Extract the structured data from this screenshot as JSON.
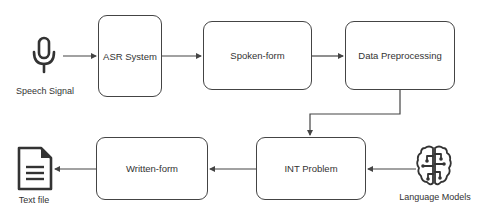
{
  "diagram": {
    "type": "flowchart",
    "direction": "left-to-right then right-to-left",
    "colors": {
      "stroke": "#444444",
      "text": "#333333",
      "background": "#ffffff"
    },
    "nodes": [
      {
        "id": "speech_signal",
        "label": "Speech Signal",
        "kind": "icon",
        "icon": "microphone-icon"
      },
      {
        "id": "asr_system",
        "label": "ASR System",
        "kind": "box"
      },
      {
        "id": "spoken_form",
        "label": "Spoken-form",
        "kind": "box"
      },
      {
        "id": "data_preprocessing",
        "label": "Data Preprocessing",
        "kind": "box"
      },
      {
        "id": "int_problem",
        "label": "INT Problem",
        "kind": "box"
      },
      {
        "id": "language_models",
        "label": "Language Models",
        "kind": "icon",
        "icon": "brain-circuit-icon"
      },
      {
        "id": "written_form",
        "label": "Written-form",
        "kind": "box"
      },
      {
        "id": "text_file",
        "label": "Text file",
        "kind": "icon",
        "icon": "document-icon"
      }
    ],
    "edges": [
      {
        "from": "speech_signal",
        "to": "asr_system"
      },
      {
        "from": "asr_system",
        "to": "spoken_form"
      },
      {
        "from": "spoken_form",
        "to": "data_preprocessing"
      },
      {
        "from": "data_preprocessing",
        "to": "int_problem"
      },
      {
        "from": "language_models",
        "to": "int_problem"
      },
      {
        "from": "int_problem",
        "to": "written_form"
      },
      {
        "from": "written_form",
        "to": "text_file"
      }
    ]
  },
  "labels": {
    "speech_signal": "Speech Signal",
    "asr_system": "ASR System",
    "spoken_form": "Spoken-form",
    "data_preprocessing": "Data Preprocessing",
    "int_problem": "INT Problem",
    "language_models": "Language Models",
    "written_form": "Written-form",
    "text_file": "Text file"
  }
}
